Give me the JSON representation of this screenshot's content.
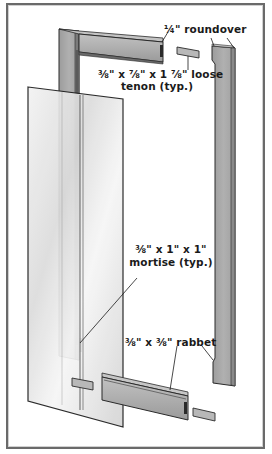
{
  "diagram": {
    "type": "exploded-view",
    "colors": {
      "wood": "#a8a8a8",
      "wood_dark": "#8a8a8a",
      "wood_light": "#c4c4c4",
      "outline": "#2a2a2a",
      "glass_light": "#f4f4f4",
      "glass_dark": "#c8c8c8",
      "border": "#6a6a6a"
    },
    "labels": {
      "roundover": "¼\" roundover",
      "tenon_line1": "⅜\" x ⅞\" x 1 ⅞\" loose",
      "tenon_line2": "tenon (typ.)",
      "mortise_line1": "⅜\" x 1\" x 1\"",
      "mortise_line2": "mortise (typ.)",
      "rabbet": "⅜\" x ⅜\" rabbet"
    },
    "parts": [
      {
        "name": "left-stile"
      },
      {
        "name": "top-rail"
      },
      {
        "name": "right-stile"
      },
      {
        "name": "bottom-rail"
      },
      {
        "name": "glass-panel"
      },
      {
        "name": "loose-tenon",
        "count": 4
      }
    ]
  }
}
